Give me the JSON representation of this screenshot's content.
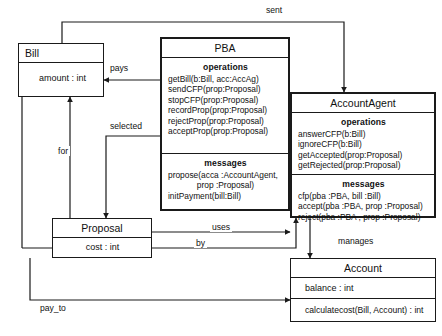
{
  "diagram": {
    "type": "uml-class-diagram",
    "background": "#ffffff",
    "stroke": "#1a1a1a"
  },
  "classes": {
    "bill": {
      "name": "Bill",
      "attributes": [
        "amount : int"
      ]
    },
    "pba": {
      "name": "PBA",
      "operations_header": "operations",
      "operations": [
        "getBill(b:Bill, acc:AccAg)",
        "sendCFP(prop:Proposal)",
        "stopCFP(prop:Proposal)",
        "recordProp(prop:Proposal)",
        "rejectProp(prop:Proposal)",
        "acceptProp(prop:Proposal)"
      ],
      "messages_header": "messages",
      "messages": [
        "propose(acca :AccountAgent,",
        "prop :Proposal)",
        "initPayment(bill:Bill)"
      ]
    },
    "account_agent": {
      "name": "AccountAgent",
      "operations_header": "operations",
      "operations": [
        "answerCFP(b:Bill)",
        "ignoreCFP(b:Bill)",
        "getAccepted(prop:Proposal)",
        "getRejected(prop:Proposal)"
      ],
      "messages_header": "messages",
      "messages": [
        "cfp(pba :PBA, bill :Bill)",
        "accept(pba :PBA, prop :Proposal)",
        "reject(pba :PBA , prop :Proposal)"
      ]
    },
    "proposal": {
      "name": "Proposal",
      "attributes": [
        "cost : int"
      ]
    },
    "account": {
      "name": "Account",
      "attributes": [
        "balance : int"
      ],
      "operations": [
        "calculatecost(Bill, Account) : int"
      ]
    }
  },
  "edges": {
    "sent": "sent",
    "pays": "pays",
    "selected": "selected",
    "for": "for",
    "uses": "uses",
    "by": "by",
    "manages": "manages",
    "pay_to": "pay_to"
  }
}
